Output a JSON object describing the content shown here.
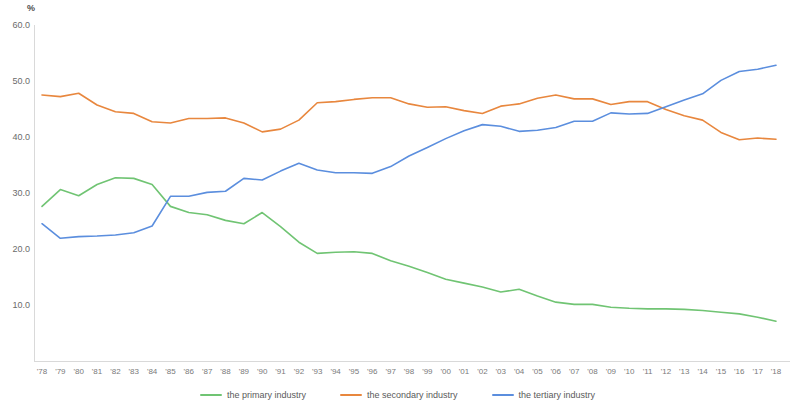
{
  "chart_data": {
    "type": "line",
    "title": "",
    "subtitle": "",
    "xlabel": "",
    "ylabel": "%",
    "unit_label": "%",
    "grid": false,
    "legend_position": "bottom",
    "ylim": [
      0,
      60
    ],
    "ytick_labels": [
      "60.0",
      "50.0",
      "40.0",
      "30.0",
      "20.0",
      "10.0"
    ],
    "ytick_values": [
      60.0,
      50.0,
      40.0,
      30.0,
      20.0,
      10.0
    ],
    "categories": [
      "'78",
      "'79",
      "'80",
      "'81",
      "'82",
      "'83",
      "'84",
      "'85",
      "'86",
      "'87",
      "'88",
      "'89",
      "'90",
      "'91",
      "'92",
      "'93",
      "'94",
      "'95",
      "'96",
      "'97",
      "'98",
      "'99",
      "'00",
      "'01",
      "'02",
      "'03",
      "'04",
      "'05",
      "'06",
      "'07",
      "'08",
      "'09",
      "'10",
      "'11",
      "'12",
      "'13",
      "'14",
      "'15",
      "'16",
      "'17",
      "'18"
    ],
    "series": [
      {
        "name": "the primary industry",
        "color": "#70c473",
        "values": [
          27.7,
          30.7,
          29.6,
          31.6,
          32.8,
          32.7,
          31.6,
          27.7,
          26.6,
          26.2,
          25.2,
          24.6,
          26.6,
          24.1,
          21.3,
          19.3,
          19.5,
          19.6,
          19.3,
          18.0,
          17.0,
          15.9,
          14.7,
          14.0,
          13.3,
          12.4,
          12.9,
          11.7,
          10.6,
          10.2,
          10.2,
          9.7,
          9.5,
          9.4,
          9.4,
          9.3,
          9.1,
          8.8,
          8.5,
          7.9,
          7.2
        ]
      },
      {
        "name": "the secondary industry",
        "color": "#e8873e",
        "values": [
          47.6,
          47.3,
          47.9,
          45.8,
          44.6,
          44.3,
          42.8,
          42.6,
          43.4,
          43.4,
          43.5,
          42.6,
          41.0,
          41.5,
          43.1,
          46.2,
          46.4,
          46.8,
          47.1,
          47.1,
          46.0,
          45.4,
          45.5,
          44.8,
          44.3,
          45.6,
          46.0,
          47.0,
          47.6,
          46.9,
          46.9,
          45.9,
          46.4,
          46.4,
          45.0,
          43.9,
          43.1,
          40.9,
          39.6,
          39.9,
          39.7
        ]
      },
      {
        "name": "the tertiary industry",
        "color": "#5b8ede",
        "values": [
          24.6,
          22.0,
          22.3,
          22.4,
          22.6,
          23.0,
          24.2,
          29.5,
          29.5,
          30.2,
          30.4,
          32.7,
          32.4,
          34.0,
          35.4,
          34.2,
          33.7,
          33.7,
          33.6,
          34.8,
          36.7,
          38.2,
          39.8,
          41.2,
          42.3,
          42.0,
          41.1,
          41.3,
          41.8,
          42.9,
          42.9,
          44.4,
          44.2,
          44.3,
          45.5,
          46.7,
          47.8,
          50.2,
          51.8,
          52.2,
          52.9
        ]
      }
    ],
    "legend": [
      {
        "label": "the primary industry",
        "color": "#70c473"
      },
      {
        "label": "the secondary industry",
        "color": "#e8873e"
      },
      {
        "label": "the tertiary industry",
        "color": "#5b8ede"
      }
    ]
  }
}
